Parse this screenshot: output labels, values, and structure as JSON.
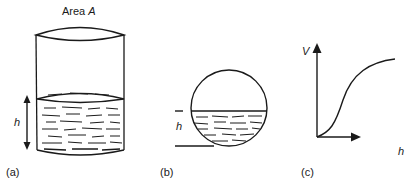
{
  "figure": {
    "panel_a": {
      "title_prefix": "Area ",
      "title_var": "A",
      "height_label": "h",
      "caption": "(a)"
    },
    "panel_b": {
      "height_label": "h",
      "caption": "(b)"
    },
    "panel_c": {
      "y_axis_label": "V",
      "x_axis_label": "h",
      "caption": "(c)"
    }
  },
  "colors": {
    "ink": "#1a1a1a",
    "background": "#ffffff"
  }
}
